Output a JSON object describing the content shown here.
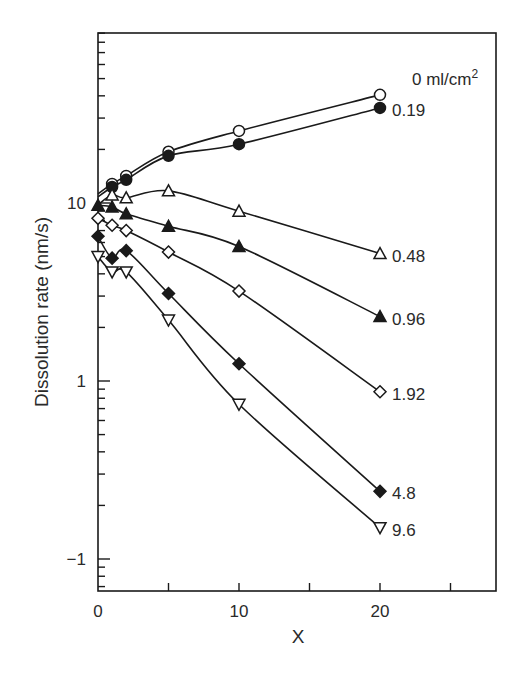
{
  "chart_data": {
    "type": "line",
    "title": "",
    "xlabel": "X",
    "ylabel": "Dissolution rate (nm/s)",
    "yscale": "log",
    "xlim": [
      0,
      28
    ],
    "ylim": [
      0.07,
      90
    ],
    "x_ticks": [
      0,
      10,
      20
    ],
    "x_tick_labels": [
      "0",
      "10",
      "20"
    ],
    "y_ticks": [
      10,
      1,
      0.1
    ],
    "y_tick_labels": [
      "10",
      "1",
      "−1"
    ],
    "grid": false,
    "legend_position": "inline-right",
    "series": [
      {
        "name": "0 ml/cm2",
        "label": "0 ml/cm",
        "label_sup": "2",
        "marker": "circle-open",
        "x": [
          1,
          2,
          5,
          10,
          20
        ],
        "values": [
          12.8,
          14.2,
          19.4,
          25.4,
          40.5
        ]
      },
      {
        "name": "0.19",
        "label": "0.19",
        "marker": "circle-filled",
        "x": [
          1,
          2,
          5,
          10,
          20
        ],
        "values": [
          12.3,
          13.5,
          18.4,
          21.4,
          34.2
        ]
      },
      {
        "name": "0.48",
        "label": "0.48",
        "marker": "triangle-up-open",
        "x": [
          1,
          2,
          5,
          10,
          20
        ],
        "values": [
          11.1,
          10.7,
          11.7,
          9.0,
          5.2
        ]
      },
      {
        "name": "0.96",
        "label": "0.96",
        "marker": "triangle-up-filled",
        "x": [
          0,
          1,
          2,
          5,
          10,
          20
        ],
        "values": [
          9.7,
          9.5,
          8.7,
          7.4,
          5.7,
          2.3
        ]
      },
      {
        "name": "1.92",
        "label": "1.92",
        "marker": "diamond-open",
        "x": [
          0,
          1,
          2,
          5,
          10,
          20
        ],
        "values": [
          8.2,
          7.5,
          7.0,
          5.3,
          3.2,
          0.87
        ]
      },
      {
        "name": "4.8",
        "label": "4.8",
        "marker": "diamond-filled",
        "x": [
          0,
          1,
          2,
          5,
          10,
          20
        ],
        "values": [
          6.5,
          4.9,
          5.4,
          3.1,
          1.25,
          0.24
        ]
      },
      {
        "name": "9.6",
        "label": "9.6",
        "marker": "triangle-down-open",
        "x": [
          0,
          1,
          2,
          5,
          10,
          20
        ],
        "values": [
          5.0,
          4.1,
          4.1,
          2.2,
          0.74,
          0.15
        ]
      }
    ]
  },
  "colors": {
    "ink": "#1a1a1a",
    "background": "#ffffff"
  }
}
